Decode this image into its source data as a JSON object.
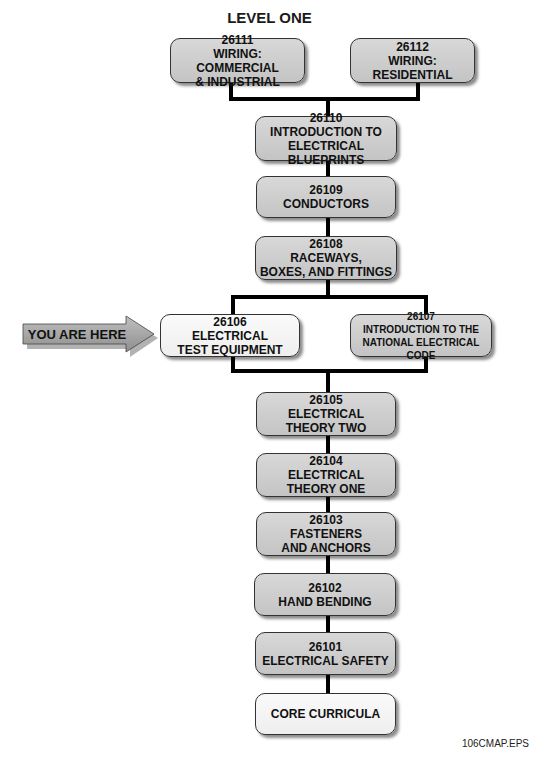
{
  "diagram": {
    "title": "LEVEL ONE",
    "you_are_here": "YOU ARE HERE",
    "file_label": "106CMAP.EPS",
    "modules": [
      {
        "id": "26111",
        "lines": [
          "26111",
          "WIRING: COMMERCIAL",
          "& INDUSTRIAL"
        ]
      },
      {
        "id": "26112",
        "lines": [
          "26112",
          "WIRING:",
          "RESIDENTIAL"
        ]
      },
      {
        "id": "26110",
        "lines": [
          "26110",
          "INTRODUCTION TO",
          "ELECTRICAL BLUEPRINTS"
        ]
      },
      {
        "id": "26109",
        "lines": [
          "26109",
          "CONDUCTORS"
        ]
      },
      {
        "id": "26108",
        "lines": [
          "26108",
          "RACEWAYS,",
          "BOXES, AND FITTINGS"
        ]
      },
      {
        "id": "26106",
        "lines": [
          "26106",
          "ELECTRICAL",
          "TEST EQUIPMENT"
        ],
        "current": true
      },
      {
        "id": "26107",
        "lines": [
          "26107",
          "INTRODUCTION TO THE",
          "NATIONAL ELECTRICAL CODE"
        ]
      },
      {
        "id": "26105",
        "lines": [
          "26105",
          "ELECTRICAL",
          "THEORY TWO"
        ]
      },
      {
        "id": "26104",
        "lines": [
          "26104",
          "ELECTRICAL",
          "THEORY ONE"
        ]
      },
      {
        "id": "26103",
        "lines": [
          "26103",
          "FASTENERS",
          "AND ANCHORS"
        ]
      },
      {
        "id": "26102",
        "lines": [
          "26102",
          "HAND BENDING"
        ]
      },
      {
        "id": "26101",
        "lines": [
          "26101",
          "ELECTRICAL SAFETY"
        ]
      },
      {
        "id": "core",
        "lines": [
          "CORE CURRICULA"
        ]
      }
    ],
    "colors": {
      "box_fill": "#cfcfcf",
      "current_fill": "#f4f4f4",
      "arrow_fill": "#a9a9a9",
      "connector": "#000000"
    }
  }
}
